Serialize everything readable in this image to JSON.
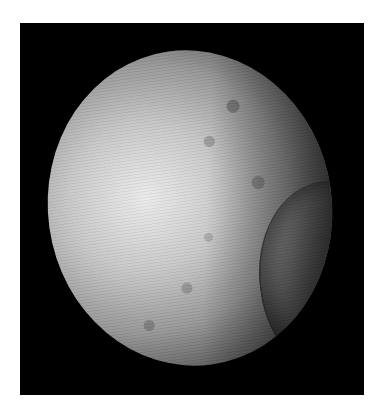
{
  "image": {
    "subject": "cratered moon",
    "background_color": "#000000",
    "page_color": "#ffffff"
  }
}
